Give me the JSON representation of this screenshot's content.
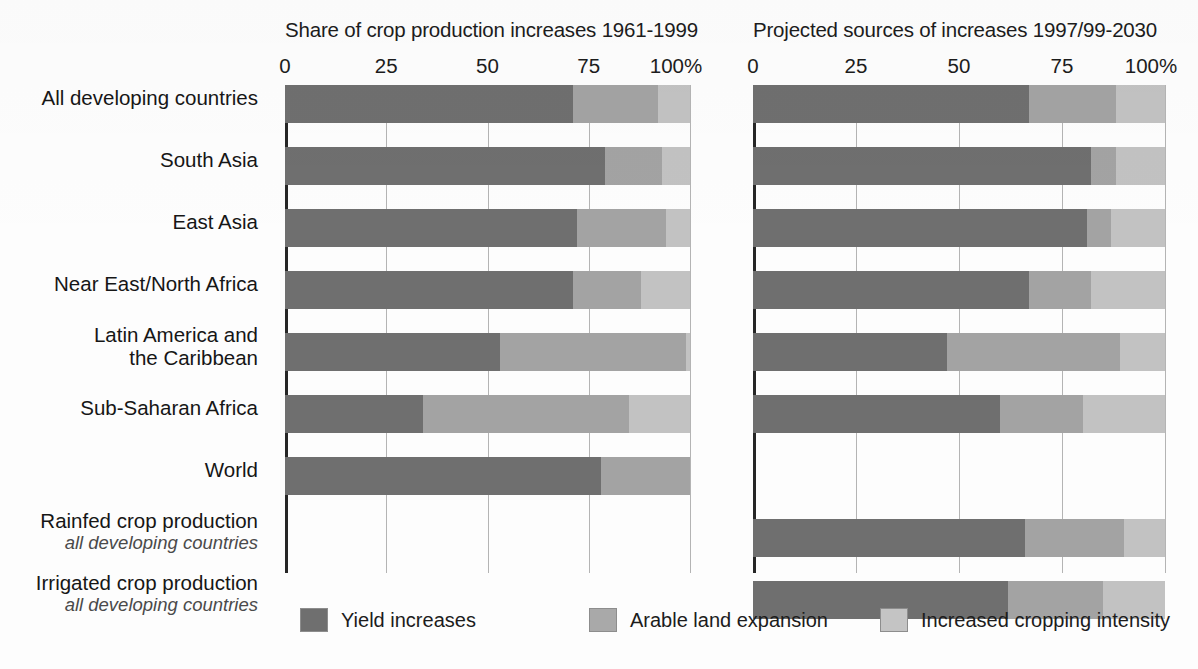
{
  "panels": [
    {
      "id": "left",
      "title": "Share of crop production increases 1961-1999"
    },
    {
      "id": "right",
      "title": "Projected sources of increases 1997/99-2030"
    }
  ],
  "axis": {
    "ticks": [
      "0",
      "25",
      "50",
      "75",
      "100%"
    ],
    "values": [
      0,
      25,
      50,
      75,
      100
    ],
    "unit": "%"
  },
  "rows": [
    {
      "label": "All developing countries",
      "sub": ""
    },
    {
      "label": "South Asia",
      "sub": ""
    },
    {
      "label": "East Asia",
      "sub": ""
    },
    {
      "label": "Near East/North Africa",
      "sub": ""
    },
    {
      "label": "Latin America and",
      "label2": "the Caribbean",
      "sub": ""
    },
    {
      "label": "Sub-Saharan Africa",
      "sub": ""
    },
    {
      "label": "World",
      "sub": ""
    },
    {
      "label": "Rainfed crop production",
      "sub": "all developing countries"
    },
    {
      "label": "Irrigated crop production",
      "sub": "all developing countries"
    }
  ],
  "legend": [
    {
      "key": "yield",
      "label": "Yield increases",
      "color": "#6f6f6f"
    },
    {
      "key": "arable",
      "label": "Arable land expansion",
      "color": "#a9a9a9"
    },
    {
      "key": "cropping",
      "label": "Increased cropping intensity",
      "color": "#c4c4c4"
    }
  ],
  "colors": {
    "yield": "#6f6f6f",
    "arable": "#a3a3a3",
    "cropping": "#c2c2c2",
    "axis": "#262626",
    "grid": "#b4b4b4",
    "background": "#fdfdfd",
    "text": "#1a1a1a"
  },
  "chart_data": {
    "type": "bar",
    "subtype": "stacked-horizontal-100pct",
    "xlabel": "",
    "ylabel": "",
    "xlim": [
      0,
      100
    ],
    "grid": true,
    "legend_position": "bottom",
    "series": [
      {
        "name": "Yield increases",
        "color": "#6f6f6f"
      },
      {
        "name": "Arable land expansion",
        "color": "#a3a3a3"
      },
      {
        "name": "Increased cropping intensity",
        "color": "#c2c2c2"
      }
    ],
    "panels": [
      {
        "title": "Share of crop production increases 1961-1999",
        "categories": [
          "All developing countries",
          "South Asia",
          "East Asia",
          "Near East/North Africa",
          "Latin America and the Caribbean",
          "Sub-Saharan Africa",
          "World",
          "Rainfed crop production (all developing countries)",
          "Irrigated crop production (all developing countries)"
        ],
        "values": [
          {
            "category": "All developing countries",
            "yield": 71,
            "arable": 21,
            "cropping": 8
          },
          {
            "category": "South Asia",
            "yield": 79,
            "arable": 14,
            "cropping": 7
          },
          {
            "category": "East Asia",
            "yield": 72,
            "arable": 22,
            "cropping": 6
          },
          {
            "category": "Near East/North Africa",
            "yield": 71,
            "arable": 17,
            "cropping": 12
          },
          {
            "category": "Latin America and the Caribbean",
            "yield": 53,
            "arable": 46,
            "cropping": 1
          },
          {
            "category": "Sub-Saharan Africa",
            "yield": 34,
            "arable": 51,
            "cropping": 15
          },
          {
            "category": "World",
            "yield": 78,
            "arable": 22,
            "cropping": 0
          },
          {
            "category": "Rainfed crop production (all developing countries)",
            "yield": null,
            "arable": null,
            "cropping": null
          },
          {
            "category": "Irrigated crop production (all developing countries)",
            "yield": null,
            "arable": null,
            "cropping": null
          }
        ]
      },
      {
        "title": "Projected sources of increases 1997/99-2030",
        "categories": [
          "All developing countries",
          "South Asia",
          "East Asia",
          "Near East/North Africa",
          "Latin America and the Caribbean",
          "Sub-Saharan Africa",
          "World",
          "Rainfed crop production (all developing countries)",
          "Irrigated crop production (all developing countries)"
        ],
        "values": [
          {
            "category": "All developing countries",
            "yield": 67,
            "arable": 21,
            "cropping": 12
          },
          {
            "category": "South Asia",
            "yield": 82,
            "arable": 6,
            "cropping": 12
          },
          {
            "category": "East Asia",
            "yield": 81,
            "arable": 6,
            "cropping": 13
          },
          {
            "category": "Near East/North Africa",
            "yield": 67,
            "arable": 15,
            "cropping": 18
          },
          {
            "category": "Latin America and the Caribbean",
            "yield": 47,
            "arable": 42,
            "cropping": 11
          },
          {
            "category": "Sub-Saharan Africa",
            "yield": 60,
            "arable": 20,
            "cropping": 20
          },
          {
            "category": "World",
            "yield": null,
            "arable": null,
            "cropping": null
          },
          {
            "category": "Rainfed crop production (all developing countries)",
            "yield": 66,
            "arable": 24,
            "cropping": 10
          },
          {
            "category": "Irrigated crop production (all developing countries)",
            "yield": 62,
            "arable": 23,
            "cropping": 15
          }
        ]
      }
    ]
  },
  "layout": {
    "row_tops": [
      0,
      62,
      124,
      186,
      248,
      310,
      372,
      434,
      496
    ],
    "bar_height": 38,
    "label_tops": [
      2,
      64,
      126,
      188,
      239,
      312,
      374,
      425,
      487
    ]
  }
}
